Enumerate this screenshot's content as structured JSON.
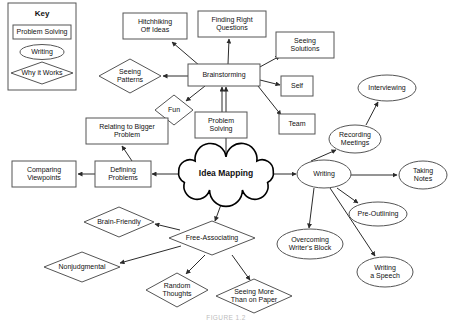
{
  "figure": {
    "title": "Idea Mapping",
    "caption": "FIGURE 1.2"
  },
  "key": {
    "title": "Key",
    "items": [
      {
        "label": "Problem Solving",
        "shape": "rectangle"
      },
      {
        "label": "Writing",
        "shape": "ellipse"
      },
      {
        "label": "Why it Works",
        "shape": "diamond"
      }
    ]
  },
  "chart_data": {
    "type": "diagram",
    "title": "Idea Mapping",
    "legend_position": "top-left",
    "shape_meanings": {
      "rectangle": "Problem Solving",
      "ellipse": "Writing",
      "diamond": "Why it Works",
      "cloud": "Central Topic"
    },
    "nodes": [
      {
        "id": "idea-mapping",
        "label": "Idea Mapping",
        "shape": "cloud",
        "x": 226,
        "y": 174,
        "w": 96,
        "h": 34
      },
      {
        "id": "brainstorming",
        "label": "Brainstorming",
        "shape": "rectangle",
        "x": 224,
        "y": 75,
        "w": 72,
        "h": 22
      },
      {
        "id": "hitchhiking-off-ideas",
        "label": "Hitchhiking\nOff Ideas",
        "shape": "rectangle",
        "x": 155,
        "y": 26,
        "w": 64,
        "h": 26
      },
      {
        "id": "finding-right-questions",
        "label": "Finding Right\nQuestions",
        "shape": "rectangle",
        "x": 232,
        "y": 24,
        "w": 68,
        "h": 26
      },
      {
        "id": "seeing-solutions",
        "label": "Seeing\nSolutions",
        "shape": "rectangle",
        "x": 305,
        "y": 45,
        "w": 58,
        "h": 26
      },
      {
        "id": "self",
        "label": "Self",
        "shape": "rectangle",
        "x": 297,
        "y": 86,
        "w": 32,
        "h": 20
      },
      {
        "id": "team",
        "label": "Team",
        "shape": "rectangle",
        "x": 297,
        "y": 124,
        "w": 36,
        "h": 20
      },
      {
        "id": "seeing-patterns",
        "label": "Seeing\nPatterns",
        "shape": "diamond",
        "x": 130,
        "y": 76,
        "w": 62,
        "h": 34
      },
      {
        "id": "fun",
        "label": "Fun",
        "shape": "diamond",
        "x": 174,
        "y": 110,
        "w": 38,
        "h": 30
      },
      {
        "id": "problem-solving",
        "label": "Problem\nSolving",
        "shape": "rectangle",
        "x": 221,
        "y": 125,
        "w": 52,
        "h": 26
      },
      {
        "id": "defining-problems",
        "label": "Defining\nProblems",
        "shape": "rectangle",
        "x": 123,
        "y": 174,
        "w": 56,
        "h": 26
      },
      {
        "id": "relating-to-bigger-problem",
        "label": "Relating to Bigger\nProblem",
        "shape": "rectangle",
        "x": 127,
        "y": 131,
        "w": 82,
        "h": 26
      },
      {
        "id": "comparing-viewpoints",
        "label": "Comparing\nViewpoints",
        "shape": "rectangle",
        "x": 44,
        "y": 174,
        "w": 64,
        "h": 26
      },
      {
        "id": "writing",
        "label": "Writing",
        "shape": "ellipse",
        "x": 324,
        "y": 174,
        "w": 54,
        "h": 28
      },
      {
        "id": "recording-meetings",
        "label": "Recording\nMeetings",
        "shape": "ellipse",
        "x": 355,
        "y": 139,
        "w": 52,
        "h": 28
      },
      {
        "id": "interviewing",
        "label": "Interviewing",
        "shape": "ellipse",
        "x": 387,
        "y": 88,
        "w": 58,
        "h": 26
      },
      {
        "id": "taking-notes",
        "label": "Taking\nNotes",
        "shape": "ellipse",
        "x": 423,
        "y": 175,
        "w": 48,
        "h": 28
      },
      {
        "id": "pre-outlining",
        "label": "Pre-Outlining",
        "shape": "ellipse",
        "x": 378,
        "y": 214,
        "w": 58,
        "h": 24
      },
      {
        "id": "overcoming-writers-block",
        "label": "Overcoming\nWriter's Block",
        "shape": "ellipse",
        "x": 310,
        "y": 244,
        "w": 66,
        "h": 30
      },
      {
        "id": "writing-a-speech",
        "label": "Writing\na Speech",
        "shape": "ellipse",
        "x": 385,
        "y": 272,
        "w": 56,
        "h": 30
      },
      {
        "id": "free-associating",
        "label": "Free-Associating",
        "shape": "diamond",
        "x": 212,
        "y": 238,
        "w": 86,
        "h": 34
      },
      {
        "id": "brain-friendly",
        "label": "Brain-Friendly",
        "shape": "diamond",
        "x": 119,
        "y": 222,
        "w": 70,
        "h": 30
      },
      {
        "id": "nonjudgmental",
        "label": "Nonjudgmental",
        "shape": "diamond",
        "x": 82,
        "y": 267,
        "w": 76,
        "h": 30
      },
      {
        "id": "random-thoughts",
        "label": "Random\nThoughts",
        "shape": "diamond",
        "x": 177,
        "y": 290,
        "w": 62,
        "h": 34
      },
      {
        "id": "seeing-more-than-on-paper",
        "label": "Seeing More\nThan on Paper",
        "shape": "diamond",
        "x": 254,
        "y": 296,
        "w": 76,
        "h": 34
      }
    ],
    "edges": [
      {
        "from": "idea-mapping",
        "to": "brainstorming",
        "x1": 226,
        "y1": 157,
        "x2": 226,
        "y2": 87
      },
      {
        "from": "idea-mapping",
        "to": "defining-problems",
        "x1": 178,
        "y1": 174,
        "x2": 152,
        "y2": 174
      },
      {
        "from": "idea-mapping",
        "to": "writing",
        "x1": 274,
        "y1": 174,
        "x2": 296,
        "y2": 174
      },
      {
        "from": "idea-mapping",
        "to": "free-associating",
        "x1": 226,
        "y1": 191,
        "x2": 215,
        "y2": 221
      },
      {
        "from": "brainstorming",
        "to": "hitchhiking-off-ideas",
        "x1": 200,
        "y1": 66,
        "x2": 172,
        "y2": 42
      },
      {
        "from": "brainstorming",
        "to": "finding-right-questions",
        "x1": 228,
        "y1": 64,
        "x2": 229,
        "y2": 39
      },
      {
        "from": "brainstorming",
        "to": "seeing-solutions",
        "x1": 258,
        "y1": 68,
        "x2": 280,
        "y2": 56
      },
      {
        "from": "brainstorming",
        "to": "self",
        "x1": 260,
        "y1": 80,
        "x2": 280,
        "y2": 85
      },
      {
        "from": "brainstorming",
        "to": "team",
        "x1": 258,
        "y1": 86,
        "x2": 281,
        "y2": 115
      },
      {
        "from": "brainstorming",
        "to": "seeing-patterns",
        "x1": 188,
        "y1": 76,
        "x2": 163,
        "y2": 76
      },
      {
        "from": "brainstorming",
        "to": "fun",
        "x1": 205,
        "y1": 86,
        "x2": 186,
        "y2": 101
      },
      {
        "from": "problem-solving",
        "to": "brainstorming",
        "x1": 222,
        "y1": 112,
        "x2": 222,
        "y2": 87
      },
      {
        "from": "defining-problems",
        "to": "comparing-viewpoints",
        "x1": 95,
        "y1": 174,
        "x2": 78,
        "y2": 174
      },
      {
        "from": "defining-problems",
        "to": "relating-to-bigger-problem",
        "x1": 132,
        "y1": 161,
        "x2": 122,
        "y2": 146
      },
      {
        "from": "writing",
        "to": "recording-meetings",
        "x1": 311,
        "y1": 161,
        "x2": 336,
        "y2": 150
      },
      {
        "from": "recording-meetings",
        "to": "interviewing",
        "x1": 366,
        "y1": 125,
        "x2": 378,
        "y2": 102
      },
      {
        "from": "writing",
        "to": "taking-notes",
        "x1": 351,
        "y1": 175,
        "x2": 397,
        "y2": 175
      },
      {
        "from": "writing",
        "to": "pre-outlining",
        "x1": 337,
        "y1": 188,
        "x2": 358,
        "y2": 203
      },
      {
        "from": "writing",
        "to": "overcoming-writers-block",
        "x1": 314,
        "y1": 188,
        "x2": 309,
        "y2": 228
      },
      {
        "from": "writing",
        "to": "writing-a-speech",
        "x1": 330,
        "y1": 188,
        "x2": 375,
        "y2": 256
      },
      {
        "from": "free-associating",
        "to": "brain-friendly",
        "x1": 180,
        "y1": 230,
        "x2": 155,
        "y2": 224
      },
      {
        "from": "free-associating",
        "to": "nonjudgmental",
        "x1": 181,
        "y1": 246,
        "x2": 120,
        "y2": 263
      },
      {
        "from": "free-associating",
        "to": "random-thoughts",
        "x1": 205,
        "y1": 255,
        "x2": 186,
        "y2": 274
      },
      {
        "from": "free-associating",
        "to": "seeing-more-than-on-paper",
        "x1": 232,
        "y1": 255,
        "x2": 250,
        "y2": 280
      }
    ]
  }
}
